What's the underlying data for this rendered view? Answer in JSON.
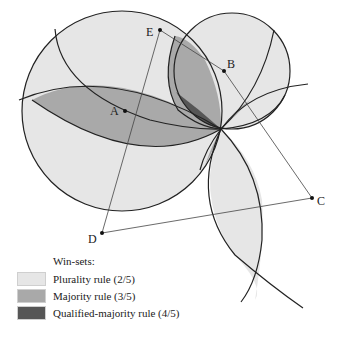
{
  "diagram": {
    "points": [
      {
        "label": "A",
        "x": 125,
        "y": 111
      },
      {
        "label": "B",
        "x": 224,
        "y": 71
      },
      {
        "label": "C",
        "x": 312,
        "y": 198
      },
      {
        "label": "D",
        "x": 102,
        "y": 233
      },
      {
        "label": "E",
        "x": 160,
        "y": 30
      }
    ],
    "ideal_point_center": {
      "x": 221,
      "y": 129
    }
  },
  "legend": {
    "title": "Win-sets:",
    "items": [
      {
        "label": "Plurality rule (2/5)",
        "color": "#e6e6e6"
      },
      {
        "label": "Majority rule (3/5)",
        "color": "#a9a9a9"
      },
      {
        "label": "Qualified-majority rule (4/5)",
        "color": "#565656"
      }
    ]
  },
  "colors": {
    "plurality": "#e6e6e6",
    "majority": "#a9a9a9",
    "qualified": "#565656",
    "stroke": "#222222"
  }
}
